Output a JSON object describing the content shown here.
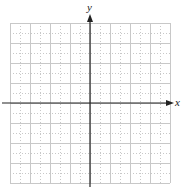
{
  "diagram": {
    "type": "coordinate-plane",
    "x_axis_label": "x",
    "y_axis_label": "y",
    "grid": {
      "cells_x": 16,
      "cells_y": 16,
      "cell_size_px": 10,
      "left": 10,
      "top": 23,
      "line_color": "#c8c8c8",
      "style": "dotted"
    },
    "axis_color": "#222222",
    "origin_px": [
      90,
      103
    ]
  }
}
